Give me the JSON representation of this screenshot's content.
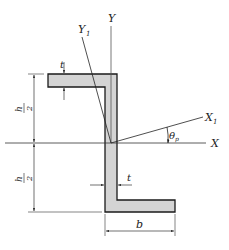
{
  "diagram": {
    "type": "Z-section cross-section with principal axes",
    "colors": {
      "fill": "#d4d4d4",
      "stroke": "#1a1a1a",
      "axis": "#333333"
    },
    "labels": {
      "y_axis": "Y",
      "y1_axis": "Y",
      "y1_sub": "1",
      "x_axis": "X",
      "x1_axis": "X",
      "x1_sub": "1",
      "theta": "θ",
      "theta_sub": "p",
      "t_top": "t",
      "t_web": "t",
      "b": "b",
      "h_num": "h",
      "h_den": "2"
    }
  }
}
